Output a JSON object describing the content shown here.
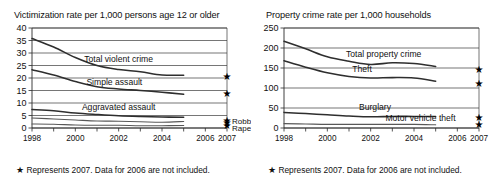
{
  "figure": {
    "footnote_star": "★",
    "footnote_text": "Represents 2007. Data for 2006 are not included."
  },
  "chart_data": [
    {
      "type": "line",
      "panel": "left",
      "title": "Victimization rate per 1,000 persons age 12 or older",
      "xlabel": "",
      "ylabel": "",
      "grid": true,
      "legend_position": "inline-labels",
      "xlim": [
        1998,
        2007
      ],
      "ylim": [
        0,
        40
      ],
      "yticks": [
        0,
        5,
        10,
        15,
        20,
        25,
        30,
        35,
        40
      ],
      "xticks": [
        1998,
        1999,
        2000,
        2001,
        2002,
        2003,
        2004,
        2005,
        2006,
        2007
      ],
      "xticklabels": [
        "1998",
        "",
        "2000",
        "",
        "2002",
        "",
        "2004",
        "",
        "2006",
        "2007"
      ],
      "x": [
        1998,
        1999,
        2000,
        2001,
        2002,
        2003,
        2004,
        2005
      ],
      "series": [
        {
          "name": "Total violent crime",
          "label": "Total violent crime",
          "values": [
            35.8,
            32.4,
            28.2,
            25.0,
            23.4,
            22.5,
            21.2,
            21.1
          ],
          "marker_2007": 20.7
        },
        {
          "name": "Simple assault",
          "label": "Simple assault",
          "values": [
            23.3,
            21.2,
            18.6,
            16.5,
            15.6,
            15.0,
            14.3,
            13.5
          ],
          "marker_2007": 13.9
        },
        {
          "name": "Aggravated assault",
          "label": "Aggravated assault",
          "values": [
            7.4,
            6.9,
            6.0,
            5.4,
            4.9,
            4.6,
            4.4,
            4.3
          ],
          "marker_2007": 3.2
        },
        {
          "name": "Robbery",
          "label": "Robbery",
          "values": [
            4.0,
            3.6,
            3.2,
            2.8,
            2.7,
            2.5,
            2.3,
            2.6
          ],
          "marker_2007": 2.4
        },
        {
          "name": "Rape",
          "label": "Rape",
          "values": [
            1.6,
            1.5,
            1.2,
            1.1,
            1.1,
            0.9,
            0.9,
            1.0
          ],
          "marker_2007": 1.0
        }
      ]
    },
    {
      "type": "line",
      "panel": "right",
      "title": "Property crime rate per 1,000 households",
      "xlabel": "",
      "ylabel": "",
      "grid": true,
      "legend_position": "inline-labels",
      "xlim": [
        1998,
        2007
      ],
      "ylim": [
        0,
        250
      ],
      "yticks": [
        0,
        50,
        100,
        150,
        200,
        250
      ],
      "xticks": [
        1998,
        1999,
        2000,
        2001,
        2002,
        2003,
        2004,
        2005,
        2006,
        2007
      ],
      "xticklabels": [
        "1998",
        "",
        "2000",
        "",
        "2002",
        "",
        "2004",
        "",
        "2006",
        "2007"
      ],
      "x": [
        1998,
        1999,
        2000,
        2001,
        2002,
        2003,
        2004,
        2005
      ],
      "series": [
        {
          "name": "Total property crime",
          "label": "Total property crime",
          "values": [
            217,
            198,
            178,
            167,
            159,
            163,
            161,
            154
          ],
          "marker_2007": 147
        },
        {
          "name": "Theft",
          "label": "Theft",
          "values": [
            168,
            152,
            138,
            129,
            125,
            126,
            125,
            117
          ],
          "marker_2007": 112
        },
        {
          "name": "Burglary",
          "label": "Burglary",
          "values": [
            39,
            36,
            33,
            30,
            28,
            29,
            29,
            29
          ],
          "marker_2007": 27
        },
        {
          "name": "Motor vehicle theft",
          "label": "Motor vehicle theft",
          "values": [
            11,
            10,
            9,
            9,
            9,
            9,
            9,
            8
          ],
          "marker_2007": 8
        }
      ]
    }
  ]
}
